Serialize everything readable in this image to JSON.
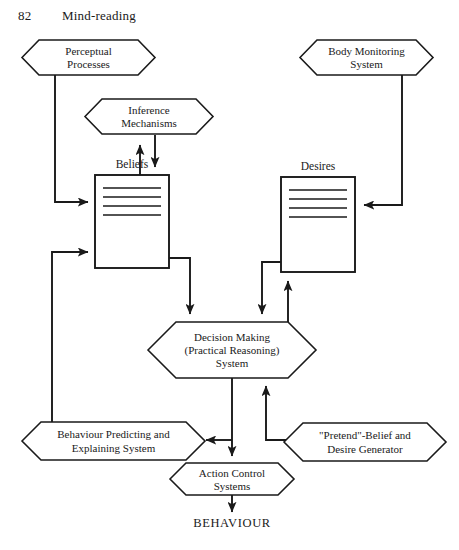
{
  "page": {
    "number": "82",
    "running_head": "Mind-reading"
  },
  "diagram": {
    "colors": {
      "ink": "#1a1a1a",
      "paper": "#ffffff"
    },
    "nodes": [
      {
        "id": "perceptual-processes",
        "shape": "hexagon",
        "lines": [
          "Perceptual",
          "Processes"
        ]
      },
      {
        "id": "body-monitoring-system",
        "shape": "hexagon",
        "lines": [
          "Body Monitoring",
          "System"
        ]
      },
      {
        "id": "inference-mechanisms",
        "shape": "hexagon",
        "lines": [
          "Inference",
          "Mechanisms"
        ]
      },
      {
        "id": "beliefs",
        "shape": "box",
        "caption": "Beliefs",
        "rules": 4
      },
      {
        "id": "desires",
        "shape": "box",
        "caption": "Desires",
        "rules": 4
      },
      {
        "id": "decision-making-system",
        "shape": "hexagon",
        "lines": [
          "Decision Making",
          "(Practical Reasoning)",
          "System"
        ]
      },
      {
        "id": "behaviour-predicting-system",
        "shape": "hexagon",
        "lines": [
          "Behaviour Predicting and",
          "Explaining System"
        ]
      },
      {
        "id": "pretend-belief-desire-generator",
        "shape": "hexagon",
        "lines": [
          "\"Pretend\"-Belief and",
          "Desire Generator"
        ]
      },
      {
        "id": "action-control-systems",
        "shape": "hexagon",
        "lines": [
          "Action Control",
          "Systems"
        ]
      },
      {
        "id": "behaviour-output",
        "shape": "text",
        "lines": [
          "BEHAVIOUR"
        ]
      }
    ],
    "edges": [
      {
        "from": "perceptual-processes",
        "to": "beliefs",
        "arrow": true
      },
      {
        "from": "body-monitoring-system",
        "to": "desires",
        "arrow": true
      },
      {
        "from": "beliefs",
        "to": "inference-mechanisms",
        "arrow": true
      },
      {
        "from": "inference-mechanisms",
        "to": "beliefs",
        "arrow": true
      },
      {
        "from": "beliefs",
        "to": "decision-making-system",
        "arrow": true
      },
      {
        "from": "desires",
        "to": "decision-making-system",
        "arrow": true
      },
      {
        "from": "decision-making-system",
        "to": "desires",
        "arrow": true
      },
      {
        "from": "decision-making-system",
        "to": "action-control-systems",
        "arrow": true
      },
      {
        "from": "decision-making-system",
        "to": "behaviour-predicting-system",
        "arrow": true
      },
      {
        "from": "behaviour-predicting-system",
        "to": "beliefs",
        "arrow": true
      },
      {
        "from": "pretend-belief-desire-generator",
        "to": "decision-making-system",
        "arrow": true
      },
      {
        "from": "action-control-systems",
        "to": "behaviour-output",
        "arrow": true
      }
    ]
  },
  "labels": {
    "perceptual_1": "Perceptual",
    "perceptual_2": "Processes",
    "body_1": "Body Monitoring",
    "body_2": "System",
    "inference_1": "Inference",
    "inference_2": "Mechanisms",
    "beliefs_caption": "Beliefs",
    "desires_caption": "Desires",
    "decision_1": "Decision Making",
    "decision_2": "(Practical Reasoning)",
    "decision_3": "System",
    "behpred_1": "Behaviour Predicting and",
    "behpred_2": "Explaining System",
    "pretend_1": "\"Pretend\"-Belief and",
    "pretend_2": "Desire Generator",
    "action_1": "Action Control",
    "action_2": "Systems",
    "behaviour_out": "BEHAVIOUR"
  }
}
